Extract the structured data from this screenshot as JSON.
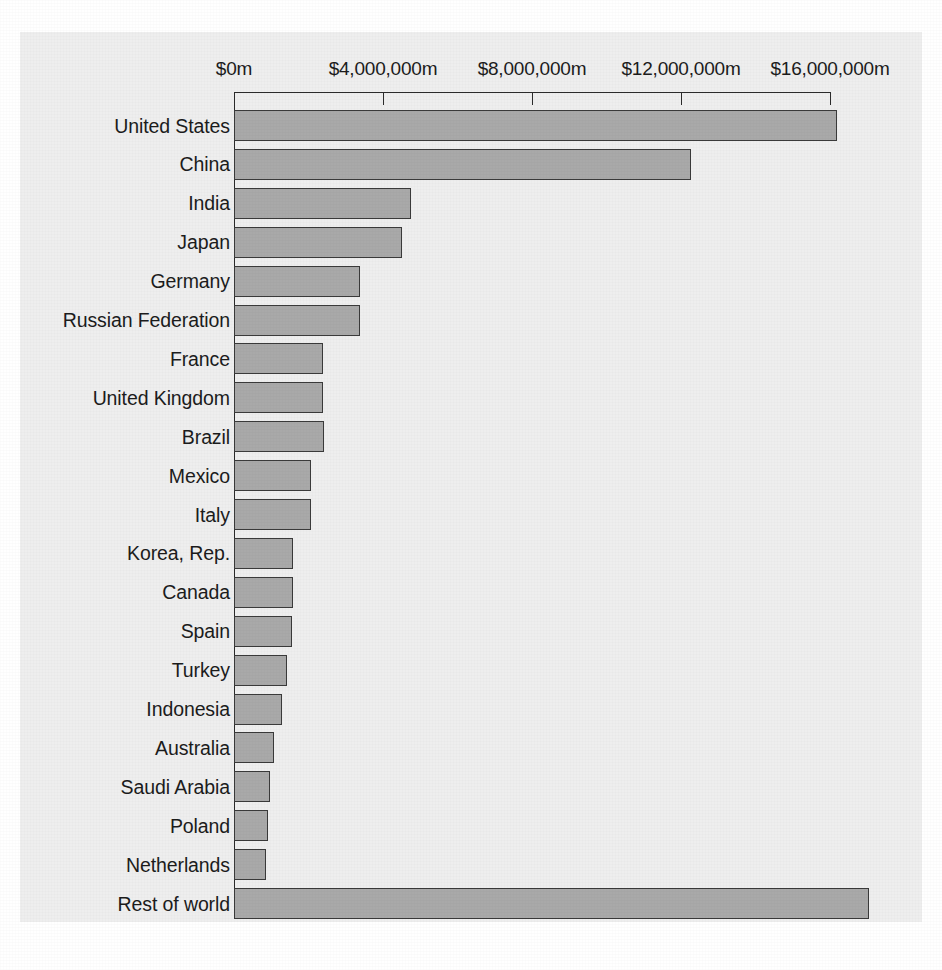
{
  "chart_data": {
    "type": "bar",
    "orientation": "horizontal",
    "title": "",
    "xlabel": "",
    "ylabel": "",
    "xlim": [
      0,
      17500000
    ],
    "axis_ticks": [
      {
        "value": 0,
        "label": "$0m"
      },
      {
        "value": 4000000,
        "label": "$4,000,000m"
      },
      {
        "value": 8000000,
        "label": "$8,000,000m"
      },
      {
        "value": 12000000,
        "label": "$12,000,000m"
      },
      {
        "value": 16000000,
        "label": "$16,000,000m"
      }
    ],
    "grid": false,
    "legend": null,
    "categories": [
      "United States",
      "China",
      "India",
      "Japan",
      "Germany",
      "Russian Federation",
      "France",
      "United Kingdom",
      "Brazil",
      "Mexico",
      "Italy",
      "Korea, Rep.",
      "Canada",
      "Spain",
      "Turkey",
      "Indonesia",
      "Australia",
      "Saudi Arabia",
      "Poland",
      "Netherlands",
      "Rest of world"
    ],
    "values": [
      16200000,
      12270000,
      4750000,
      4500000,
      3380000,
      3380000,
      2390000,
      2390000,
      2420000,
      2070000,
      2070000,
      1580000,
      1580000,
      1560000,
      1420000,
      1290000,
      1070000,
      970000,
      910000,
      860000,
      17050000
    ],
    "units": "$m",
    "bar_fill_color": "#a9a9a9",
    "bar_edge_color": "#3a3a3a",
    "panel_background": "#eeeeee",
    "page_background": "#ffffff"
  },
  "caption": {
    "text": ""
  }
}
